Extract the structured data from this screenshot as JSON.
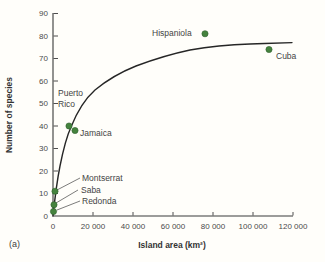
{
  "figure": {
    "panel_label": "(a)"
  },
  "chart_data": {
    "type": "scatter",
    "title": "",
    "xlabel": "Island area (km²)",
    "ylabel": "Number of species",
    "xlim": [
      0,
      120000
    ],
    "ylim": [
      0,
      90
    ],
    "grid": false,
    "legend": "none",
    "x_ticks": [
      0,
      20000,
      40000,
      60000,
      80000,
      100000,
      120000
    ],
    "x_tick_labels": [
      "0",
      "20 000",
      "40 000",
      "60 000",
      "80 000",
      "100 000",
      "120 000"
    ],
    "y_ticks": [
      0,
      10,
      20,
      30,
      40,
      50,
      60,
      70,
      80,
      90
    ],
    "y_tick_labels": [
      "0",
      "10",
      "20",
      "30",
      "40",
      "50",
      "60",
      "70",
      "80",
      "90"
    ],
    "point_color": "#45833e",
    "point_edge_color": "#2e5f2c",
    "curve_color": "#262626",
    "curve_note": "asymptotic species-area fit curve rising steeply then leveling near 77 species",
    "points": [
      {
        "label": "Hispaniola",
        "area_km2": 76000,
        "species": 81
      },
      {
        "label": "Cuba",
        "area_km2": 108000,
        "species": 74
      },
      {
        "label": "Puerto Rico",
        "area_km2": 8000,
        "species": 40
      },
      {
        "label": "Jamaica",
        "area_km2": 11000,
        "species": 38
      },
      {
        "label": "Montserrat",
        "area_km2": 1000,
        "species": 11
      },
      {
        "label": "Saba",
        "area_km2": 500,
        "species": 5
      },
      {
        "label": "Redonda",
        "area_km2": 250,
        "species": 2
      }
    ]
  }
}
